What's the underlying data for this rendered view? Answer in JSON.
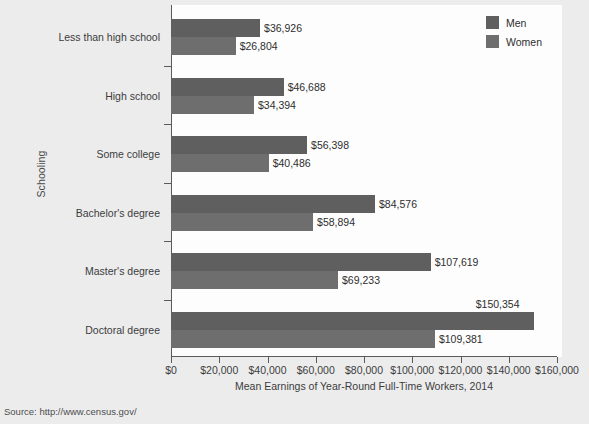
{
  "chart_data": {
    "type": "bar",
    "orientation": "horizontal",
    "title": "",
    "xlabel": "Mean Earnings of Year-Round Full-Time Workers, 2014",
    "ylabel": "Schooling",
    "categories": [
      "Less than high school",
      "High school",
      "Some college",
      "Bachelor's degree",
      "Master's degree",
      "Doctoral degree"
    ],
    "series": [
      {
        "name": "Men",
        "color": "#5f5f5f",
        "values": [
          36926,
          46688,
          56398,
          84576,
          107619,
          150354
        ],
        "labels": [
          "$36,926",
          "$46,688",
          "$56,398",
          "$84,576",
          "$107,619",
          "$150,354"
        ]
      },
      {
        "name": "Women",
        "color": "#6e6e6e",
        "values": [
          26804,
          34394,
          40486,
          58894,
          69233,
          109381
        ],
        "labels": [
          "$26,804",
          "$34,394",
          "$40,486",
          "$58,894",
          "$69,233",
          "$109,381"
        ]
      }
    ],
    "xlim": [
      0,
      160000
    ],
    "xticks": [
      0,
      20000,
      40000,
      60000,
      80000,
      100000,
      120000,
      140000,
      160000
    ],
    "xtick_labels": [
      "$0",
      "$20,000",
      "$40,000",
      "$60,000",
      "$80,000",
      "$100,000",
      "$120,000",
      "$140,000",
      "$160,000"
    ],
    "grid": false,
    "legend_position": "top-right",
    "legend_entries": [
      "Men",
      "Women"
    ]
  },
  "source": {
    "text": "Source: http://www.census.gov/"
  },
  "colors": {
    "men_bar": "#5f5f5f",
    "women_bar": "#6e6e6e",
    "page_background": "#ececed",
    "plot_background": "#fdfdfd",
    "axis": "#5a5a5a"
  }
}
